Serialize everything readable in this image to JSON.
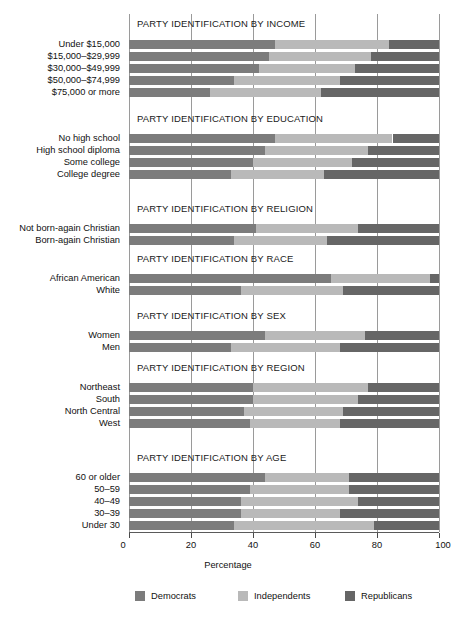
{
  "chart_data": {
    "type": "bar",
    "subtype": "stacked-horizontal-bar",
    "title": "",
    "xlabel": "Percentage",
    "ylabel": "",
    "xlim": [
      0,
      100
    ],
    "xticks": [
      0,
      20,
      40,
      60,
      80,
      100
    ],
    "xtick_labels": [
      "0",
      "20",
      "40",
      "60",
      "80",
      "100"
    ],
    "grid": "vertical",
    "legend_position": "bottom",
    "series": [
      {
        "name": "Democrats",
        "color": "#7c7c7c"
      },
      {
        "name": "Independents",
        "color": "#b9b9b9"
      },
      {
        "name": "Republicans",
        "color": "#666666"
      }
    ],
    "panels": [
      {
        "title": "PARTY IDENTIFICATION BY INCOME",
        "categories": [
          "Under $15,000",
          "$15,000–$29,999",
          "$30,000–$49,999",
          "$50,000–$74,999",
          "$75,000 or more"
        ],
        "values": {
          "Democrats": [
            47,
            45,
            42,
            34,
            26
          ],
          "Independents": [
            37,
            33,
            31,
            34,
            36
          ],
          "Republicans": [
            16,
            22,
            27,
            32,
            38
          ]
        }
      },
      {
        "title": "PARTY IDENTIFICATION BY EDUCATION",
        "categories": [
          "No high school",
          "High school diploma",
          "Some college",
          "College degree"
        ],
        "values": {
          "Democrats": [
            47,
            44,
            40,
            33
          ],
          "Independents": [
            38,
            33,
            32,
            30
          ],
          "Republicans": [
            15,
            23,
            28,
            37
          ]
        }
      },
      {
        "title": "PARTY IDENTIFICATION BY RELIGION",
        "categories": [
          "Not born-again Christian",
          "Born-again Christian"
        ],
        "values": {
          "Democrats": [
            41,
            34
          ],
          "Independents": [
            33,
            30
          ],
          "Republicans": [
            26,
            36
          ]
        }
      },
      {
        "title": "PARTY IDENTIFICATION BY RACE",
        "categories": [
          "African American",
          "White"
        ],
        "values": {
          "Democrats": [
            65,
            36
          ],
          "Independents": [
            32,
            33
          ],
          "Republicans": [
            3,
            31
          ]
        }
      },
      {
        "title": "PARTY IDENTIFICATION BY SEX",
        "categories": [
          "Women",
          "Men"
        ],
        "values": {
          "Democrats": [
            44,
            33
          ],
          "Independents": [
            32,
            35
          ],
          "Republicans": [
            24,
            32
          ]
        }
      },
      {
        "title": "PARTY IDENTIFICATION BY REGION",
        "categories": [
          "Northeast",
          "South",
          "North Central",
          "West"
        ],
        "values": {
          "Democrats": [
            40,
            40,
            37,
            39
          ],
          "Independents": [
            37,
            34,
            32,
            29
          ],
          "Republicans": [
            23,
            26,
            31,
            32
          ]
        }
      },
      {
        "title": "PARTY IDENTIFICATION BY AGE",
        "categories": [
          "60 or older",
          "50–59",
          "40–49",
          "30–39",
          "Under 30"
        ],
        "values": {
          "Democrats": [
            44,
            39,
            36,
            36,
            34
          ],
          "Independents": [
            27,
            32,
            38,
            32,
            45
          ],
          "Republicans": [
            29,
            29,
            26,
            32,
            21
          ]
        }
      }
    ]
  },
  "legend": {
    "items": [
      {
        "label": "Democrats",
        "color": "#7c7c7c"
      },
      {
        "label": "Independents",
        "color": "#b9b9b9"
      },
      {
        "label": "Republicans",
        "color": "#666666"
      }
    ]
  },
  "axis": {
    "title": "Percentage",
    "tick_labels": [
      "0",
      "20",
      "40",
      "60",
      "80",
      "100"
    ]
  }
}
